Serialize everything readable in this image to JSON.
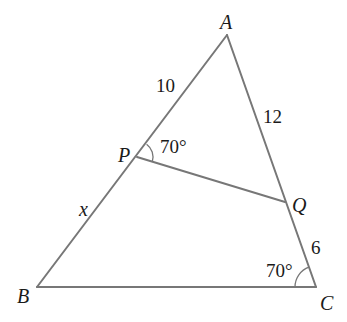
{
  "diagram": {
    "type": "triangle-geometry",
    "colors": {
      "line": "#777777",
      "text": "#1a1a1a",
      "background": "#ffffff"
    },
    "vertices": {
      "A": {
        "label": "A",
        "x": 227,
        "y": 35
      },
      "B": {
        "label": "B",
        "x": 37,
        "y": 287
      },
      "C": {
        "label": "C",
        "x": 316,
        "y": 287
      },
      "P": {
        "label": "P",
        "x": 137,
        "y": 157
      },
      "Q": {
        "label": "Q",
        "x": 285,
        "y": 202
      }
    },
    "segments": [
      {
        "from": "A",
        "to": "B"
      },
      {
        "from": "A",
        "to": "C"
      },
      {
        "from": "B",
        "to": "C"
      },
      {
        "from": "P",
        "to": "Q"
      }
    ],
    "lengths": {
      "AP": "10",
      "AQ": "12",
      "PB": "x",
      "QC": "6"
    },
    "angles": {
      "APQ": "70°",
      "ACB": "70°"
    }
  }
}
